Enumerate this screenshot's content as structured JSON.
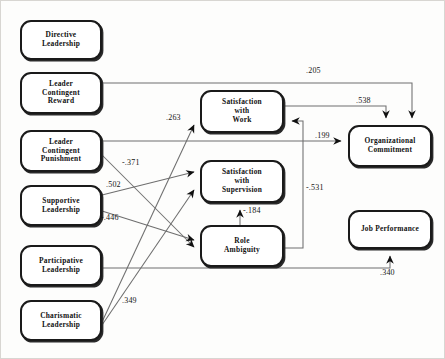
{
  "diagram": {
    "type": "path-diagram",
    "nodes": [
      {
        "id": "directive",
        "label_line1": "Directive",
        "label_line2": "Leadership",
        "label_line3": "",
        "x": 20,
        "y": 20,
        "w": 82,
        "h": 40
      },
      {
        "id": "lcr",
        "label_line1": "Leader",
        "label_line2": "Contingent",
        "label_line3": "Reward",
        "x": 20,
        "y": 72,
        "w": 82,
        "h": 42
      },
      {
        "id": "lcp",
        "label_line1": "Leader",
        "label_line2": "Contingent",
        "label_line3": "Punishment",
        "x": 20,
        "y": 130,
        "w": 82,
        "h": 42
      },
      {
        "id": "supportive",
        "label_line1": "Supportive",
        "label_line2": "Leadership",
        "label_line3": "",
        "x": 20,
        "y": 185,
        "w": 82,
        "h": 41
      },
      {
        "id": "participative",
        "label_line1": "Participative",
        "label_line2": "Leadership",
        "label_line3": "",
        "x": 20,
        "y": 245,
        "w": 82,
        "h": 41
      },
      {
        "id": "charismatic",
        "label_line1": "Charismatic",
        "label_line2": "Leadership",
        "label_line3": "",
        "x": 20,
        "y": 300,
        "w": 82,
        "h": 41
      },
      {
        "id": "satwork",
        "label_line1": "Satisfaction",
        "label_line2": "with",
        "label_line3": "Work",
        "x": 200,
        "y": 90,
        "w": 84,
        "h": 43
      },
      {
        "id": "satsup",
        "label_line1": "Satisfaction",
        "label_line2": "with",
        "label_line3": "Supervision",
        "x": 200,
        "y": 160,
        "w": 84,
        "h": 43
      },
      {
        "id": "roleamb",
        "label_line1": "Role",
        "label_line2": "Ambiguity",
        "label_line3": "",
        "x": 200,
        "y": 225,
        "w": 84,
        "h": 42
      },
      {
        "id": "orgcommit",
        "label_line1": "Organizational",
        "label_line2": "Commitment",
        "label_line3": "",
        "x": 348,
        "y": 125,
        "w": 84,
        "h": 42
      },
      {
        "id": "jobperf",
        "label_line1": "Job Performance",
        "label_line2": "",
        "label_line3": "",
        "x": 348,
        "y": 210,
        "w": 84,
        "h": 39
      }
    ],
    "edges": [
      {
        "id": "e205",
        "from": "lcr",
        "to": "orgcommit",
        "coefficient": ".205",
        "label_x": 306,
        "label_y": 66
      },
      {
        "id": "e538",
        "from": "satwork",
        "to": "orgcommit",
        "coefficient": ".538",
        "label_x": 356,
        "label_y": 96
      },
      {
        "id": "e263",
        "from": "charismatic",
        "to": "satwork",
        "coefficient": ".263",
        "label_x": 166,
        "label_y": 113
      },
      {
        "id": "e199",
        "from": "lcp",
        "to": "orgcommit",
        "coefficient": ".199",
        "label_x": 315,
        "label_y": 131
      },
      {
        "id": "e371",
        "from": "lcp",
        "to": "roleamb",
        "coefficient": "-.371",
        "label_x": 122,
        "label_y": 158
      },
      {
        "id": "e502",
        "from": "supportive",
        "to": "satsup",
        "coefficient": ".502",
        "label_x": 106,
        "label_y": 180
      },
      {
        "id": "e446",
        "from": "supportive",
        "to": "roleamb",
        "coefficient": "-.446",
        "label_x": 101,
        "label_y": 213
      },
      {
        "id": "e531",
        "from": "roleamb",
        "to": "satwork",
        "coefficient": "-.531",
        "label_x": 306,
        "label_y": 183
      },
      {
        "id": "e184",
        "from": "roleamb",
        "to": "satsup",
        "coefficient": "-.184",
        "label_x": 243,
        "label_y": 206
      },
      {
        "id": "e349",
        "from": "charismatic",
        "to": "satsup",
        "coefficient": ".349",
        "label_x": 122,
        "label_y": 296
      },
      {
        "id": "e340",
        "from": "participative",
        "to": "jobperf",
        "coefficient": ".340",
        "label_x": 380,
        "label_y": 268
      }
    ]
  }
}
